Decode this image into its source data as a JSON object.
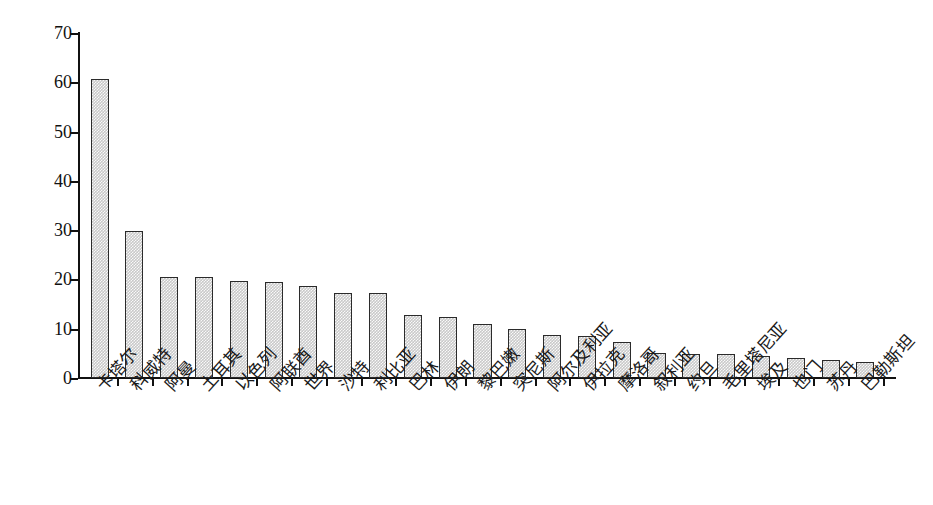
{
  "chart_data": {
    "type": "bar",
    "title": "",
    "subtitle": "",
    "xlabel": "",
    "ylabel": "",
    "ylim": [
      0,
      70
    ],
    "ytick_labels": [
      "0",
      "10",
      "20",
      "30",
      "40",
      "50",
      "60",
      "70"
    ],
    "ytick_values": [
      0,
      10,
      20,
      30,
      40,
      50,
      60,
      70
    ],
    "grid": false,
    "legend": null,
    "bar_fill_color": "#c9c9c9",
    "bar_border_color": "#2b2b2b",
    "axis_color": "#111111",
    "background_color": "#ffffff",
    "categories": [
      "卡塔尔",
      "科威特",
      "阿曼",
      "土耳其",
      "以色列",
      "阿联酋",
      "世界",
      "沙特",
      "利比亚",
      "巴林",
      "伊朗",
      "黎巴嫩",
      "突尼斯",
      "阿尔及利亚",
      "伊拉克",
      "摩洛哥",
      "叙利亚",
      "约旦",
      "毛里塔尼亚",
      "埃及",
      "也门",
      "苏丹",
      "巴勒斯坦"
    ],
    "values": [
      60.6,
      29.9,
      20.5,
      20.4,
      19.7,
      19.4,
      18.7,
      17.3,
      17.2,
      12.8,
      12.3,
      10.9,
      10.0,
      8.8,
      8.5,
      7.4,
      5.1,
      4.9,
      4.9,
      4.5,
      4.1,
      3.7,
      3.3
    ]
  }
}
